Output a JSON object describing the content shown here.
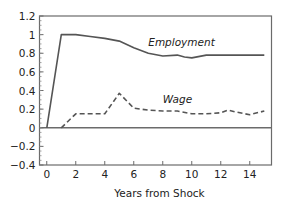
{
  "chart_data": {
    "type": "line",
    "title": "",
    "xlabel": "Years from Shock",
    "ylabel": "",
    "xlim": [
      -0.5,
      15.5
    ],
    "ylim": [
      -0.4,
      1.2
    ],
    "xticks": [
      0,
      2,
      4,
      6,
      8,
      10,
      12,
      14
    ],
    "xtick_labels": [
      "0",
      "2",
      "4",
      "6",
      "8",
      "10",
      "12",
      "14"
    ],
    "yticks": [
      1.2,
      1,
      0.8,
      0.6,
      0.4,
      0.2,
      0,
      -0.2,
      -0.4
    ],
    "ytick_labels": [
      "1.2",
      "1",
      "0.8",
      "0.6",
      "0.4",
      "0.2",
      "0",
      "−0.2",
      "−0.4"
    ],
    "zero_line": true,
    "grid": false,
    "legend": "none (inline series labels)",
    "series": [
      {
        "name": "Employment",
        "label": "Employment",
        "style": "solid",
        "color": "#555555",
        "x": [
          0,
          1,
          2,
          3,
          4,
          5,
          6,
          7,
          8,
          9,
          9.5,
          10,
          11,
          12,
          13,
          14,
          15
        ],
        "y": [
          0,
          1.0,
          1.0,
          0.98,
          0.96,
          0.93,
          0.86,
          0.8,
          0.77,
          0.78,
          0.76,
          0.75,
          0.78,
          0.78,
          0.78,
          0.78,
          0.78
        ]
      },
      {
        "name": "Wage",
        "label": "Wage",
        "style": "dashed",
        "color": "#555555",
        "x": [
          1,
          2,
          3,
          4,
          5,
          6,
          7,
          8,
          9,
          10,
          11,
          12,
          12.5,
          13,
          14,
          15
        ],
        "y": [
          0,
          0.15,
          0.15,
          0.15,
          0.37,
          0.21,
          0.19,
          0.18,
          0.18,
          0.15,
          0.15,
          0.16,
          0.19,
          0.17,
          0.14,
          0.18
        ]
      }
    ]
  }
}
